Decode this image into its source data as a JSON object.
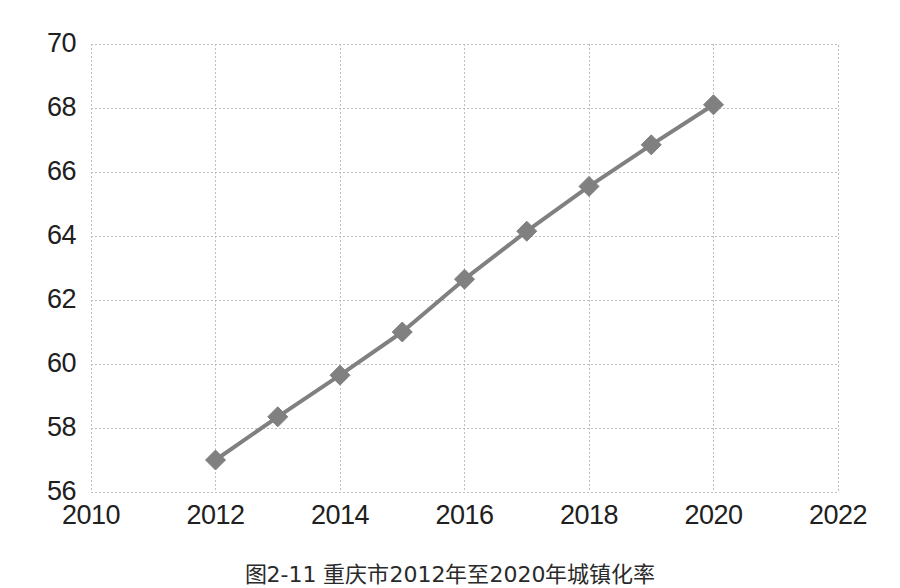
{
  "figure": {
    "caption": "图2-11  重庆市2012年至2020年城镇化率"
  },
  "axes": {
    "y_ticks": [
      "70",
      "68",
      "66",
      "64",
      "62",
      "60",
      "58",
      "56"
    ],
    "x_ticks": [
      "2010",
      "2012",
      "2014",
      "2016",
      "2018",
      "2020",
      "2022"
    ]
  },
  "style": {
    "series_color": "#808080",
    "grid_color": "#bfbfbf",
    "background": "#ffffff",
    "text_color": "#202020"
  },
  "chart_data": {
    "type": "line",
    "title": "图2-11  重庆市2012年至2020年城镇化率",
    "xlabel": "",
    "ylabel": "",
    "xlim": [
      2010,
      2022
    ],
    "ylim": [
      56,
      70
    ],
    "xticks": [
      2010,
      2012,
      2014,
      2016,
      2018,
      2020,
      2022
    ],
    "yticks": [
      56,
      58,
      60,
      62,
      64,
      66,
      68,
      70
    ],
    "grid": true,
    "grid_style": "dashed",
    "legend": false,
    "marker": "diamond",
    "x": [
      2012,
      2013,
      2014,
      2015,
      2016,
      2017,
      2018,
      2019,
      2020
    ],
    "values": [
      57.0,
      58.35,
      59.65,
      61.0,
      62.65,
      64.15,
      65.55,
      66.85,
      68.1
    ],
    "series": [
      {
        "name": "城镇化率",
        "color": "#808080",
        "values": [
          57.0,
          58.35,
          59.65,
          61.0,
          62.65,
          64.15,
          65.55,
          66.85,
          68.1
        ]
      }
    ]
  }
}
